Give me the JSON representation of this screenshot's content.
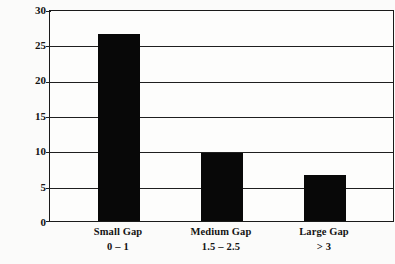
{
  "chart_data": {
    "type": "bar",
    "title": "",
    "xlabel": "",
    "ylabel": "Return on Equity (%)",
    "categories": [
      "Small Gap",
      "Medium Gap",
      "Large Gap"
    ],
    "category_sublabels": [
      "0 – 1",
      "1.5 – 2.5",
      "> 3"
    ],
    "values": [
      26.7,
      9.7,
      6.6
    ],
    "ylim": [
      0,
      30
    ],
    "yticks": [
      0,
      5,
      10,
      15,
      20,
      25,
      30
    ],
    "ytick_labels": [
      "0",
      "5",
      "10",
      "15",
      "20",
      "25",
      "30"
    ],
    "grid": true,
    "legend": "none",
    "bar_color": "#080808",
    "axis_color": "#1a1a1a",
    "background_color": "#fbfbfa"
  }
}
